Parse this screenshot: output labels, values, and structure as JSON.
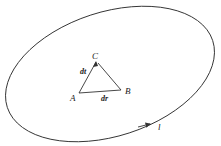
{
  "diagram": {
    "type": "closed-loop-with-triangle",
    "curve_label": "l",
    "vertices": [
      {
        "id": "A",
        "label": "A"
      },
      {
        "id": "B",
        "label": "B"
      },
      {
        "id": "C",
        "label": "C"
      }
    ],
    "edge_labels": {
      "AC": "dt",
      "AB": "dr"
    },
    "colors": {
      "stroke": "#333333",
      "background": "#ffffff"
    }
  }
}
